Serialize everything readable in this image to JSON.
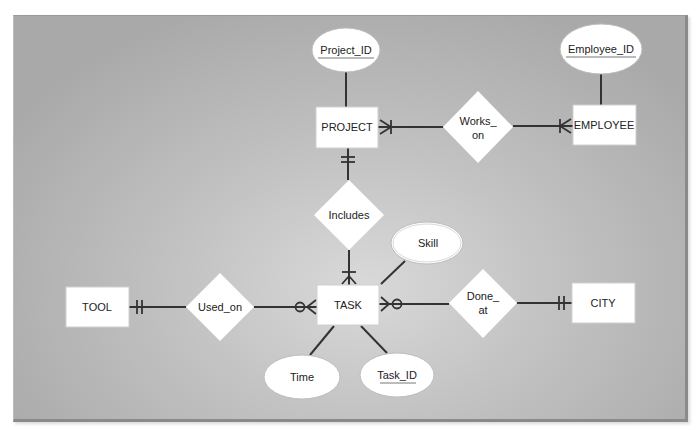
{
  "diagram": {
    "type": "entity-relationship",
    "notation": "crow's foot",
    "entities": [
      {
        "id": "project",
        "label": "PROJECT"
      },
      {
        "id": "employee",
        "label": "EMPLOYEE"
      },
      {
        "id": "task",
        "label": "TASK"
      },
      {
        "id": "tool",
        "label": "TOOL"
      },
      {
        "id": "city",
        "label": "CITY"
      }
    ],
    "relationships": [
      {
        "id": "works_on",
        "label_line1": "Works_",
        "label_line2": "on",
        "between": [
          "PROJECT",
          "EMPLOYEE"
        ],
        "cardinality": [
          "one-or-many",
          "one-or-many"
        ]
      },
      {
        "id": "includes",
        "label": "Includes",
        "between": [
          "PROJECT",
          "TASK"
        ],
        "cardinality": [
          "one-and-only-one",
          "one-or-many"
        ]
      },
      {
        "id": "used_on",
        "label": "Used_on",
        "between": [
          "TOOL",
          "TASK"
        ],
        "cardinality": [
          "one-and-only-one",
          "zero-or-many"
        ]
      },
      {
        "id": "done_at",
        "label_line1": "Done_",
        "label_line2": "at",
        "between": [
          "TASK",
          "CITY"
        ],
        "cardinality": [
          "zero-or-many",
          "one-and-only-one"
        ]
      }
    ],
    "attributes": [
      {
        "id": "project_id",
        "label": "Project_ID",
        "entity": "PROJECT",
        "key": true
      },
      {
        "id": "employee_id",
        "label": "Employee_ID",
        "entity": "EMPLOYEE",
        "key": true
      },
      {
        "id": "skill",
        "label": "Skill",
        "entity": "TASK",
        "key": false
      },
      {
        "id": "time",
        "label": "Time",
        "entity": "TASK",
        "key": false
      },
      {
        "id": "task_id",
        "label": "Task_ID",
        "entity": "TASK",
        "key": true
      }
    ]
  },
  "labels": {
    "project": "PROJECT",
    "employee": "EMPLOYEE",
    "task": "TASK",
    "tool": "TOOL",
    "city": "CITY",
    "works_on_1": "Works_",
    "works_on_2": "on",
    "includes": "Includes",
    "used_on": "Used_on",
    "done_at_1": "Done_",
    "done_at_2": "at",
    "project_id": "Project_ID",
    "employee_id": "Employee_ID",
    "skill": "Skill",
    "time": "Time",
    "task_id": "Task_ID"
  },
  "colors": {
    "background_center": "#d9d9d9",
    "background_edge": "#a9a9a9",
    "shape_fill": "#ffffff",
    "line": "#333333"
  }
}
